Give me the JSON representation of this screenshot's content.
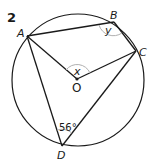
{
  "problem_number": "2",
  "points": {
    "A": {
      "label": "A",
      "x": 27,
      "y": 36
    },
    "B": {
      "label": "B",
      "x": 114,
      "y": 22
    },
    "C": {
      "label": "C",
      "x": 136,
      "y": 51
    },
    "D": {
      "label": "D",
      "x": 62,
      "y": 146
    },
    "O": {
      "label": "O",
      "x": 77,
      "y": 79
    }
  },
  "circle": {
    "cx": 78,
    "cy": 80,
    "r": 66
  },
  "angles": {
    "at_B": "y",
    "at_O": "x",
    "at_D": "56°"
  },
  "colors": {
    "line": "#1a1a1a",
    "arc": "#b0b0b0"
  }
}
